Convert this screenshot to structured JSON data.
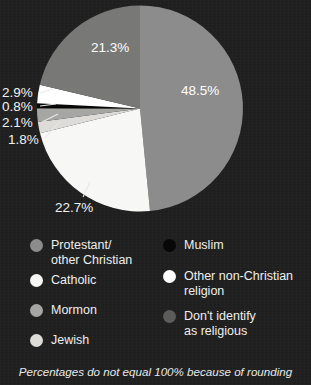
{
  "background_color": "#1f1f1f",
  "chart_data": {
    "type": "pie",
    "title": "",
    "subtitle": "",
    "xlabel": "",
    "ylabel": "",
    "legend_position": "bottom",
    "grid": false,
    "note": "Percentages do not equal 100% because of rounding",
    "total_labeled": "100.1%",
    "start_angle_deg": 0,
    "direction": "clockwise",
    "categories": [
      "Protestant/other Christian",
      "Catholic",
      "Jewish",
      "Mormon",
      "Muslim",
      "Other non-Christian religion",
      "Don't identify as religious"
    ],
    "values": [
      48.5,
      22.7,
      1.8,
      2.1,
      0.8,
      2.9,
      21.3
    ],
    "slices": [
      {
        "label": "48.5%",
        "value": 48.5,
        "category": "Protestant/other Christian",
        "color": "#8c8c8c",
        "label_placement": "inside"
      },
      {
        "label": "22.7%",
        "value": 22.7,
        "category": "Catholic",
        "color": "#f7f7f5",
        "label_placement": "callout"
      },
      {
        "label": "1.8%",
        "value": 1.8,
        "category": "Jewish",
        "color": "#dedcd8",
        "label_placement": "callout"
      },
      {
        "label": "2.1%",
        "value": 2.1,
        "category": "Mormon",
        "color": "#a6a6a4",
        "label_placement": "callout"
      },
      {
        "label": "0.8%",
        "value": 0.8,
        "category": "Muslim",
        "color": "#070707",
        "label_placement": "callout"
      },
      {
        "label": "2.9%",
        "value": 2.9,
        "category": "Other non-Christian religion",
        "color": "#ffffff",
        "label_placement": "callout"
      },
      {
        "label": "21.3%",
        "value": 21.3,
        "category": "Don't identify as religious",
        "color": "#787876",
        "label_placement": "inside"
      }
    ]
  },
  "inside_labels": [
    {
      "name": "slice-label-48-5",
      "text": "48.5%"
    },
    {
      "name": "slice-label-21-3",
      "text": "21.3%"
    }
  ],
  "callout_labels": [
    {
      "name": "callout-label-2-9",
      "text": "2.9%"
    },
    {
      "name": "callout-label-0-8",
      "text": "0.8%"
    },
    {
      "name": "callout-label-2-1",
      "text": "2.1%"
    },
    {
      "name": "callout-label-1-8",
      "text": "1.8%"
    },
    {
      "name": "callout-label-22-7",
      "text": "22.7%"
    }
  ],
  "legend": {
    "left_column": [
      {
        "label": "Protestant/\nother Christian",
        "color": "#8c8c8c",
        "swatch_name": "legend-swatch-protestant"
      },
      {
        "label": "Catholic",
        "color": "#f7f7f5",
        "swatch_name": "legend-swatch-catholic"
      },
      {
        "label": "Mormon",
        "color": "#a6a6a4",
        "swatch_name": "legend-swatch-mormon"
      },
      {
        "label": "Jewish",
        "color": "#dedcd8",
        "swatch_name": "legend-swatch-jewish"
      }
    ],
    "right_column": [
      {
        "label": "Muslim",
        "color": "#070707",
        "swatch_name": "legend-swatch-muslim"
      },
      {
        "label": "Other non-Christian\nreligion",
        "color": "#ffffff",
        "swatch_name": "legend-swatch-other-religion"
      },
      {
        "label": "Don't identify\nas religious",
        "color": "#5c5c5a",
        "swatch_name": "legend-swatch-not-religious"
      }
    ]
  },
  "footnote": {
    "text": "Percentages do not equal 100% because of rounding"
  }
}
